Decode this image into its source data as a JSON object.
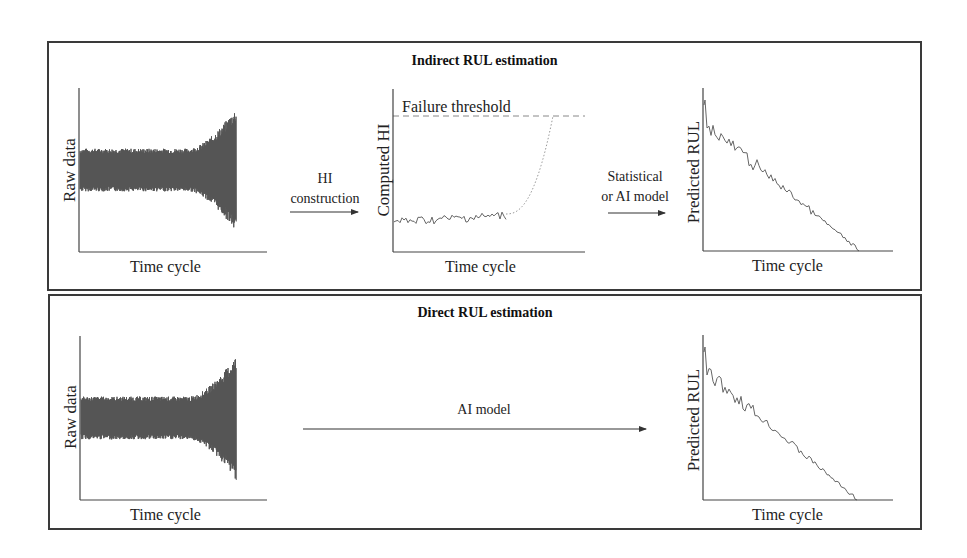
{
  "panels": {
    "indirect": {
      "title": "Indirect RUL estimation",
      "raw_plot": {
        "ylabel": "Raw data",
        "xlabel": "Time cycle"
      },
      "step1": {
        "line1": "HI",
        "line2": "construction"
      },
      "hi_plot": {
        "ylabel": "Computed HI",
        "xlabel": "Time cycle",
        "threshold_label": "Failure threshold"
      },
      "step2": {
        "line1": "Statistical",
        "line2": "or AI model"
      },
      "rul_plot": {
        "ylabel": "Predicted RUL",
        "xlabel": "Time cycle"
      }
    },
    "direct": {
      "title": "Direct RUL estimation",
      "raw_plot": {
        "ylabel": "Raw data",
        "xlabel": "Time cycle"
      },
      "step": {
        "label": "AI model"
      },
      "rul_plot": {
        "ylabel": "Predicted RUL",
        "xlabel": "Time cycle"
      }
    }
  },
  "colors": {
    "border": "#3a3a3a",
    "signal": "#555555",
    "curve": "#666666",
    "dotted": "#888888",
    "axis": "#444444"
  }
}
